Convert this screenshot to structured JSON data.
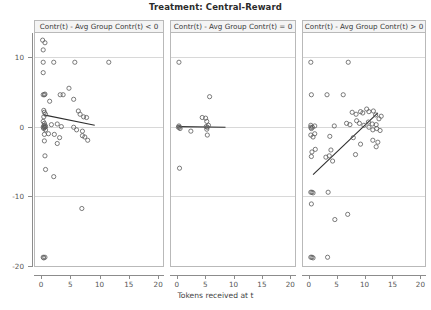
{
  "figure": {
    "title": "Treatment: Central-Reward",
    "xlabel": "Tokens received at t",
    "ylabel": "Contr(t+1) - Contr(t)"
  },
  "axes": {
    "x_ticks": [
      "0",
      "5",
      "10",
      "15",
      "20"
    ],
    "y_ticks": [
      "10",
      "0",
      "-10",
      "-20"
    ]
  },
  "chart_data": {
    "type": "scatter",
    "title": "Treatment: Central-Reward",
    "xlabel": "Tokens received at t",
    "ylabel": "Contr(t+1) - Contr(t)",
    "xlim": [
      -1.2,
      21
    ],
    "ylim": [
      -21.5,
      14.5
    ],
    "xticks": [
      0,
      5,
      10,
      15,
      20
    ],
    "yticks": [
      10,
      0,
      -10,
      -20
    ],
    "grid": "horizontal gridlines at y = 10, 0, -10, -20",
    "legend": "none",
    "layout": "three horizontal facet panels sharing x and y axes",
    "panels": [
      {
        "label": "Contr(t) - Avg Group Contr(t) < 0",
        "points": [
          [
            0.1,
            13.4
          ],
          [
            0.5,
            13.0
          ],
          [
            0.2,
            11.9
          ],
          [
            0.2,
            10.0
          ],
          [
            2.0,
            10.0
          ],
          [
            5.6,
            10.0
          ],
          [
            11.4,
            10.0
          ],
          [
            0.2,
            8.4
          ],
          [
            0.2,
            5.0
          ],
          [
            0.4,
            5.0
          ],
          [
            0.5,
            5.1
          ],
          [
            3.1,
            5.0
          ],
          [
            3.6,
            5.0
          ],
          [
            4.6,
            6.0
          ],
          [
            5.4,
            4.3
          ],
          [
            1.3,
            4.0
          ],
          [
            0.3,
            2.6
          ],
          [
            0.4,
            2.3
          ],
          [
            0.6,
            2.0
          ],
          [
            0.3,
            1.6
          ],
          [
            6.2,
            2.5
          ],
          [
            6.5,
            2.0
          ],
          [
            7.1,
            1.6
          ],
          [
            7.6,
            1.5
          ],
          [
            0.2,
            0.9
          ],
          [
            0.4,
            0.6
          ],
          [
            0.5,
            0.3
          ],
          [
            0.3,
            0.2
          ],
          [
            0.6,
            0.1
          ],
          [
            1.6,
            0.4
          ],
          [
            2.6,
            0.5
          ],
          [
            3.3,
            0.1
          ],
          [
            0.2,
            0.0
          ],
          [
            0.4,
            0.0
          ],
          [
            0.5,
            0.0
          ],
          [
            0.3,
            -0.2
          ],
          [
            0.6,
            -0.4
          ],
          [
            5.4,
            0.0
          ],
          [
            5.9,
            -0.4
          ],
          [
            6.9,
            -0.6
          ],
          [
            0.4,
            -1.1
          ],
          [
            1.1,
            -1.0
          ],
          [
            2.1,
            -1.1
          ],
          [
            3.0,
            -1.6
          ],
          [
            6.9,
            -1.3
          ],
          [
            7.3,
            -1.5
          ],
          [
            7.8,
            -2.0
          ],
          [
            0.4,
            -2.1
          ],
          [
            2.6,
            -2.5
          ],
          [
            0.5,
            -4.4
          ],
          [
            0.6,
            -6.5
          ],
          [
            2.0,
            -7.6
          ],
          [
            6.8,
            -12.5
          ],
          [
            0.2,
            -20.0
          ],
          [
            0.5,
            -20.0
          ],
          [
            0.3,
            -20.1
          ]
        ],
        "fit_line": {
          "x0": 0.3,
          "y0": 1.9,
          "x1": 9.0,
          "y1": 0.3,
          "slope": "negative"
        }
      },
      {
        "label": "Contr(t) - Avg Group Contr(t) = 0",
        "points": [
          [
            0.2,
            10.0
          ],
          [
            5.6,
            4.7
          ],
          [
            4.3,
            1.5
          ],
          [
            4.9,
            1.4
          ],
          [
            5.1,
            0.9
          ],
          [
            0.1,
            0.0
          ],
          [
            0.3,
            0.0
          ],
          [
            0.2,
            0.2
          ],
          [
            0.4,
            -0.2
          ],
          [
            5.0,
            0.1
          ],
          [
            5.2,
            0.0
          ],
          [
            5.4,
            0.3
          ],
          [
            5.1,
            -0.3
          ],
          [
            2.3,
            -0.6
          ],
          [
            5.2,
            -1.2
          ],
          [
            0.3,
            -6.3
          ]
        ],
        "fit_line": {
          "x0": 0.1,
          "y0": 0.1,
          "x1": 8.4,
          "y1": 0.0,
          "slope": "flat"
        }
      },
      {
        "label": "Contr(t) - Avg Group Contr(t) > 0",
        "points": [
          [
            0.2,
            10.0
          ],
          [
            6.9,
            10.0
          ],
          [
            0.3,
            5.0
          ],
          [
            3.1,
            5.0
          ],
          [
            6.0,
            5.0
          ],
          [
            7.6,
            2.3
          ],
          [
            8.3,
            2.0
          ],
          [
            9.1,
            2.4
          ],
          [
            9.5,
            2.2
          ],
          [
            10.2,
            2.8
          ],
          [
            10.6,
            2.4
          ],
          [
            11.4,
            2.5
          ],
          [
            11.8,
            1.9
          ],
          [
            12.4,
            1.3
          ],
          [
            12.8,
            1.7
          ],
          [
            6.6,
            0.6
          ],
          [
            7.2,
            0.4
          ],
          [
            8.4,
            1.0
          ],
          [
            8.9,
            0.6
          ],
          [
            9.7,
            0.3
          ],
          [
            10.5,
            0.8
          ],
          [
            11.2,
            0.5
          ],
          [
            11.9,
            0.4
          ],
          [
            0.2,
            0.3
          ],
          [
            0.9,
            0.2
          ],
          [
            4.4,
            0.2
          ],
          [
            0.2,
            0.0
          ],
          [
            0.5,
            0.0
          ],
          [
            0.3,
            -0.2
          ],
          [
            10.6,
            0.0
          ],
          [
            11.3,
            -0.4
          ],
          [
            12.0,
            -0.2
          ],
          [
            12.6,
            -0.5
          ],
          [
            0.2,
            -1.2
          ],
          [
            0.6,
            -1.5
          ],
          [
            0.9,
            -1.0
          ],
          [
            3.6,
            -1.4
          ],
          [
            7.8,
            -1.6
          ],
          [
            9.1,
            -2.6
          ],
          [
            11.3,
            -2.0
          ],
          [
            12.2,
            -2.3
          ],
          [
            11.9,
            -3.0
          ],
          [
            0.4,
            -3.8
          ],
          [
            1.0,
            -3.4
          ],
          [
            3.8,
            -3.5
          ],
          [
            0.3,
            -4.5
          ],
          [
            2.9,
            -4.6
          ],
          [
            3.5,
            -4.4
          ],
          [
            4.1,
            -5.2
          ],
          [
            8.2,
            -4.2
          ],
          [
            0.2,
            -10.0
          ],
          [
            0.4,
            -10.0
          ],
          [
            0.6,
            -10.1
          ],
          [
            3.3,
            -10.0
          ],
          [
            0.3,
            -11.8
          ],
          [
            4.5,
            -14.2
          ],
          [
            6.8,
            -13.4
          ],
          [
            0.2,
            -20.0
          ],
          [
            0.4,
            -20.0
          ],
          [
            0.6,
            -20.1
          ],
          [
            3.2,
            -20.0
          ]
        ],
        "fit_line": {
          "x0": 0.6,
          "y0": -7.3,
          "x1": 12.2,
          "y1": 2.2,
          "slope": "positive"
        }
      }
    ]
  }
}
